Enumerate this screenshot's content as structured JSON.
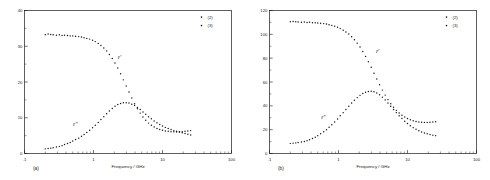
{
  "figure": {
    "panels": [
      {
        "id": "a",
        "panel_label": "(a)",
        "legend": [
          {
            "marker": "dot",
            "label": "(2)"
          },
          {
            "marker": "dot",
            "label": "(3)"
          }
        ],
        "annotations": [
          {
            "text": "ε'",
            "x_ghz": 2.0,
            "y": 26.5
          },
          {
            "text": "ε\"",
            "x_ghz": 0.45,
            "y": 7.6
          }
        ]
      },
      {
        "id": "b",
        "panel_label": "(b)",
        "legend": [
          {
            "marker": "dot",
            "label": "(2)"
          },
          {
            "marker": "dot",
            "label": "(3)"
          }
        ],
        "annotations": [
          {
            "text": "ε'",
            "x_ghz": 3.1,
            "y": 84.0
          },
          {
            "text": "ε\"",
            "x_ghz": 0.5,
            "y": 29.0
          }
        ]
      }
    ]
  },
  "chart_data": [
    {
      "type": "scatter",
      "panel": "(a)",
      "title": "",
      "xlabel": "Frequency / GHz",
      "ylabel": "",
      "xscale": "log",
      "xlim": [
        0.1,
        100
      ],
      "ylim": [
        0,
        40
      ],
      "xticks": [
        0.1,
        1,
        10,
        100
      ],
      "xticklabels": [
        ".1",
        "1",
        "10",
        "100"
      ],
      "yticks": [
        0,
        10,
        20,
        30,
        40
      ],
      "yticklabels": [
        "0",
        "10",
        "20",
        "30",
        "40"
      ],
      "grid": false,
      "legend_position": "top-right",
      "legend": [
        "(2)",
        "(3)"
      ],
      "series": [
        {
          "name": "ε'",
          "annotation": "ε'",
          "x": [
            0.2,
            0.22,
            0.24,
            0.26,
            0.29,
            0.32,
            0.35,
            0.38,
            0.42,
            0.46,
            0.5,
            0.55,
            0.61,
            0.67,
            0.73,
            0.8,
            0.88,
            0.97,
            1.06,
            1.17,
            1.28,
            1.41,
            1.55,
            1.7,
            1.87,
            2.05,
            2.25,
            2.47,
            2.71,
            2.98,
            3.27,
            3.59,
            3.94,
            4.33,
            4.75,
            5.21,
            5.72,
            6.28,
            6.9,
            7.57,
            8.31,
            9.12,
            10.0,
            11.0,
            12.1,
            13.3,
            14.6,
            16.0,
            17.6,
            19.3,
            21.2,
            23.3,
            25.6
          ],
          "y": [
            33.2,
            33.4,
            33.3,
            33.2,
            33.1,
            33.2,
            33.0,
            33.1,
            33.0,
            32.9,
            32.9,
            32.8,
            32.7,
            32.6,
            32.4,
            32.2,
            32.0,
            31.7,
            31.3,
            30.8,
            30.2,
            29.5,
            28.7,
            27.7,
            26.6,
            25.3,
            23.9,
            22.3,
            20.6,
            18.9,
            17.2,
            15.5,
            13.9,
            12.5,
            11.3,
            10.2,
            9.3,
            8.5,
            7.9,
            7.4,
            7.0,
            6.7,
            6.5,
            6.3,
            6.2,
            6.1,
            6.1,
            6.0,
            6.1,
            6.1,
            6.2,
            6.3,
            6.4
          ]
        },
        {
          "name": "ε\"",
          "annotation": "ε\"",
          "x": [
            0.2,
            0.22,
            0.24,
            0.26,
            0.29,
            0.32,
            0.35,
            0.38,
            0.42,
            0.46,
            0.5,
            0.55,
            0.61,
            0.67,
            0.73,
            0.8,
            0.88,
            0.97,
            1.06,
            1.17,
            1.28,
            1.41,
            1.55,
            1.7,
            1.87,
            2.05,
            2.25,
            2.47,
            2.71,
            2.98,
            3.27,
            3.59,
            3.94,
            4.33,
            4.75,
            5.21,
            5.72,
            6.28,
            6.9,
            7.57,
            8.31,
            9.12,
            10.0,
            11.0,
            12.1,
            13.3,
            14.6,
            16.0,
            17.6,
            19.3,
            21.2,
            23.3,
            25.6
          ],
          "y": [
            1.3,
            1.4,
            1.5,
            1.6,
            1.8,
            2.0,
            2.2,
            2.5,
            2.8,
            3.1,
            3.5,
            3.9,
            4.3,
            4.8,
            5.3,
            5.9,
            6.5,
            7.2,
            7.9,
            8.7,
            9.5,
            10.3,
            11.1,
            11.9,
            12.6,
            13.2,
            13.7,
            14.0,
            14.2,
            14.2,
            14.1,
            13.8,
            13.4,
            12.9,
            12.3,
            11.6,
            11.0,
            10.3,
            9.7,
            9.1,
            8.6,
            8.1,
            7.7,
            7.3,
            7.0,
            6.7,
            6.4,
            6.2,
            6.0,
            5.8,
            5.6,
            5.4,
            5.2
          ]
        }
      ]
    },
    {
      "type": "scatter",
      "panel": "(b)",
      "title": "",
      "xlabel": "Frequency / GHz",
      "ylabel": "",
      "xscale": "log",
      "xlim": [
        0.1,
        100
      ],
      "ylim": [
        0,
        120
      ],
      "xticks": [
        0.1,
        1,
        10,
        100
      ],
      "xticklabels": [
        ".1",
        "1",
        "10",
        "100"
      ],
      "yticks": [
        0,
        20,
        40,
        60,
        80,
        100,
        120
      ],
      "yticklabels": [
        "0",
        "20",
        "40",
        "60",
        "80",
        "100",
        "120"
      ],
      "grid": false,
      "legend_position": "top-right",
      "legend": [
        "(2)",
        "(3)"
      ],
      "series": [
        {
          "name": "ε'",
          "annotation": "ε'",
          "x": [
            0.2,
            0.22,
            0.24,
            0.26,
            0.29,
            0.32,
            0.35,
            0.38,
            0.42,
            0.46,
            0.5,
            0.55,
            0.61,
            0.67,
            0.73,
            0.8,
            0.88,
            0.97,
            1.06,
            1.17,
            1.28,
            1.41,
            1.55,
            1.7,
            1.87,
            2.05,
            2.25,
            2.47,
            2.71,
            2.98,
            3.27,
            3.59,
            3.94,
            4.33,
            4.75,
            5.21,
            5.72,
            6.28,
            6.9,
            7.57,
            8.31,
            9.12,
            10.0,
            11.0,
            12.1,
            13.3,
            14.6,
            16.0,
            17.6,
            19.3,
            21.2,
            23.3,
            25.6
          ],
          "y": [
            110.5,
            110.8,
            110.6,
            110.4,
            110.2,
            110.3,
            110.0,
            110.1,
            109.8,
            109.7,
            109.5,
            109.3,
            109.0,
            108.6,
            108.1,
            107.5,
            106.8,
            105.9,
            104.8,
            103.5,
            102.0,
            100.2,
            98.0,
            95.5,
            92.6,
            89.3,
            85.6,
            81.5,
            77.0,
            72.3,
            67.4,
            62.5,
            57.7,
            53.2,
            49.0,
            45.2,
            41.8,
            38.8,
            36.2,
            34.0,
            32.1,
            30.6,
            29.3,
            28.3,
            27.5,
            26.9,
            26.5,
            26.2,
            26.1,
            26.1,
            26.2,
            26.4,
            26.7
          ]
        },
        {
          "name": "ε\"",
          "annotation": "ε\"",
          "x": [
            0.2,
            0.22,
            0.24,
            0.26,
            0.29,
            0.32,
            0.35,
            0.38,
            0.42,
            0.46,
            0.5,
            0.55,
            0.61,
            0.67,
            0.73,
            0.8,
            0.88,
            0.97,
            1.06,
            1.17,
            1.28,
            1.41,
            1.55,
            1.7,
            1.87,
            2.05,
            2.25,
            2.47,
            2.71,
            2.98,
            3.27,
            3.59,
            3.94,
            4.33,
            4.75,
            5.21,
            5.72,
            6.28,
            6.9,
            7.57,
            8.31,
            9.12,
            10.0,
            11.0,
            12.1,
            13.3,
            14.6,
            16.0,
            17.6,
            19.3,
            21.2,
            23.3,
            25.6
          ],
          "y": [
            8.5,
            8.7,
            8.9,
            9.2,
            9.6,
            10.1,
            10.8,
            11.6,
            12.6,
            13.7,
            15.0,
            16.5,
            18.2,
            20.0,
            22.0,
            24.2,
            26.5,
            29.0,
            31.6,
            34.3,
            37.0,
            39.7,
            42.3,
            44.7,
            46.9,
            48.8,
            50.3,
            51.4,
            52.0,
            52.2,
            51.8,
            50.8,
            49.3,
            47.3,
            45.0,
            42.4,
            39.7,
            37.0,
            34.3,
            31.7,
            29.3,
            27.1,
            25.1,
            23.3,
            21.7,
            20.3,
            19.1,
            18.1,
            17.2,
            16.5,
            15.9,
            15.4,
            15.0
          ]
        }
      ]
    }
  ]
}
